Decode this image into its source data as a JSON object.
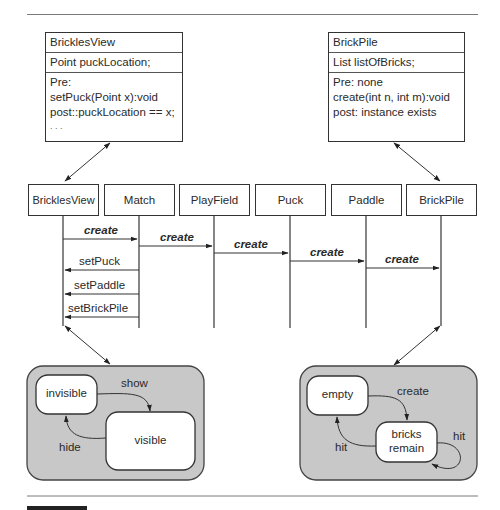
{
  "class_boxes": {
    "left": {
      "name": "BricklesView",
      "attribute": "Point puckLocation;",
      "operations": [
        "Pre:",
        "setPuck(Point x):void",
        "post::puckLocation == x;",
        ". . ."
      ]
    },
    "right": {
      "name": "BrickPile",
      "attribute": "List listOfBricks;",
      "operations": [
        "Pre: none",
        "create(int n, int m):void",
        "post: instance exists",
        ""
      ]
    }
  },
  "lifelines": [
    "BricklesView",
    "Match",
    "PlayField",
    "Puck",
    "Paddle",
    "BrickPile"
  ],
  "messages": [
    {
      "label": "create",
      "from": "BricklesView",
      "to": "Match",
      "style": "bold-italic"
    },
    {
      "label": "create",
      "from": "Match",
      "to": "PlayField",
      "style": "bold-italic"
    },
    {
      "label": "create",
      "from": "PlayField",
      "to": "Puck",
      "style": "bold-italic"
    },
    {
      "label": "create",
      "from": "Puck",
      "to": "Paddle",
      "style": "bold-italic"
    },
    {
      "label": "create",
      "from": "Paddle",
      "to": "BrickPile",
      "style": "bold-italic"
    },
    {
      "label": "setPuck",
      "from": "Match",
      "to": "BricklesView",
      "style": "normal"
    },
    {
      "label": "setPaddle",
      "from": "Match",
      "to": "BricklesView",
      "style": "normal"
    },
    {
      "label": "setBrickPile",
      "from": "Match",
      "to": "BricklesView",
      "style": "normal"
    }
  ],
  "state_machines": {
    "left": {
      "states": [
        "invisible",
        "visible"
      ],
      "transitions": [
        {
          "label": "show",
          "from": "invisible",
          "to": "visible"
        },
        {
          "label": "hide",
          "from": "visible",
          "to": "invisible"
        }
      ]
    },
    "right": {
      "states": [
        "empty",
        "bricks remain"
      ],
      "state_lines": {
        "bricks_remain": [
          "bricks",
          "remain"
        ]
      },
      "transitions": [
        {
          "label": "create",
          "from": "empty",
          "to": "bricks remain"
        },
        {
          "label": "hit",
          "from": "bricks remain",
          "to": "empty"
        },
        {
          "label": "hit",
          "from": "bricks remain",
          "to": "bricks remain"
        }
      ]
    }
  },
  "colors": {
    "line": "#333333",
    "container_fill": "#c8c8c8",
    "state_fill": "#ffffff",
    "rule": "#7a7a7a"
  }
}
